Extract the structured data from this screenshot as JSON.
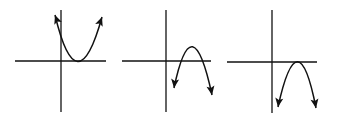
{
  "diagram": {
    "stroke_color": "#111111",
    "background": "#ffffff",
    "graphs": [
      {
        "id": "graph-1",
        "opens": "up",
        "vertex_position": "on x-axis, right of y-axis",
        "axes": {
          "h": [
            15,
            61,
            106,
            61
          ],
          "v": [
            61,
            10,
            61,
            112
          ]
        },
        "curve": "M 55 15 Q 77 107 102 17",
        "arrows": [
          {
            "x": 55,
            "y": 15,
            "angle": -110
          },
          {
            "x": 102,
            "y": 17,
            "angle": -70
          }
        ]
      },
      {
        "id": "graph-2",
        "opens": "down",
        "vertex_position": "above x-axis, right of y-axis",
        "axes": {
          "h": [
            122,
            61,
            211,
            61
          ],
          "v": [
            166,
            10,
            166,
            112
          ]
        },
        "curve": "M 174 88 Q 192 2 212 95",
        "arrows": [
          {
            "x": 174,
            "y": 88,
            "angle": 97
          },
          {
            "x": 212,
            "y": 95,
            "angle": 80
          }
        ]
      },
      {
        "id": "graph-3",
        "opens": "down",
        "vertex_position": "on x-axis, right of y-axis",
        "axes": {
          "h": [
            227,
            62,
            317,
            62
          ],
          "v": [
            272,
            10,
            272,
            113
          ]
        },
        "curve": "M 278 107 Q 298 16 316 108",
        "arrows": [
          {
            "x": 278,
            "y": 107,
            "angle": 98
          },
          {
            "x": 316,
            "y": 108,
            "angle": 80
          }
        ]
      }
    ]
  }
}
